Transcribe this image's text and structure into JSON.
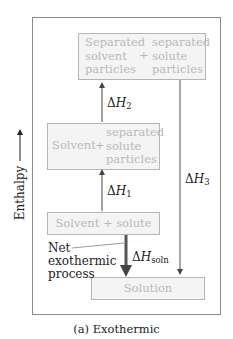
{
  "diagram": {
    "type": "enthalpy-level-diagram",
    "y_axis_label": "Enthalpy",
    "states": {
      "separated_both": {
        "left": [
          "Separated",
          "solvent",
          "particles"
        ],
        "plus": "+",
        "right": [
          "separated",
          "solute",
          "particles"
        ]
      },
      "solvent_plus_separated_solute": {
        "left": "Solvent",
        "plus": "+",
        "right": [
          "separated",
          "solute",
          "particles"
        ]
      },
      "solvent_plus_solute": {
        "label": "Solvent + solute"
      },
      "solution": {
        "label": "Solution"
      }
    },
    "arrows": {
      "dh1": {
        "symbol": "Δ",
        "var": "H",
        "sub": "1",
        "direction": "up"
      },
      "dh2": {
        "symbol": "Δ",
        "var": "H",
        "sub": "2",
        "direction": "up"
      },
      "dh3": {
        "symbol": "Δ",
        "var": "H",
        "sub": "3",
        "direction": "down"
      },
      "dhsoln": {
        "symbol": "Δ",
        "var": "H",
        "sub": "soln",
        "direction": "down"
      }
    },
    "annotation": [
      "Net",
      "exothermic",
      "process"
    ],
    "caption": "(a) Exothermic",
    "colors": {
      "frame": "#8a8a8a",
      "box_border": "#b5b5b5",
      "box_fill": "#f4f4f4",
      "box_text": "#b9b9b9",
      "arrow": "#555555",
      "text": "#222222"
    }
  }
}
